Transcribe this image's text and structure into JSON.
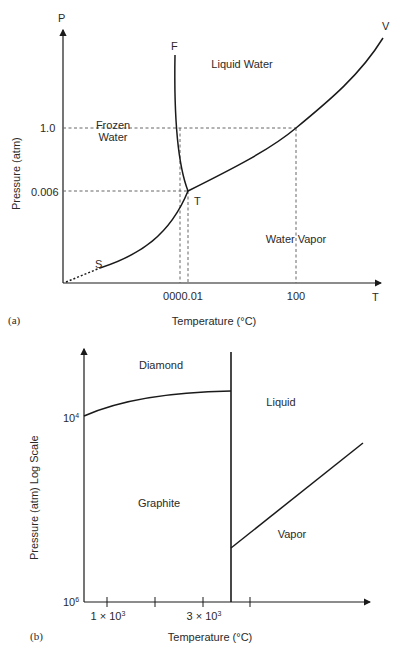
{
  "figure_a": {
    "panel_label": "(a)",
    "y_axis_symbol": "P",
    "x_axis_symbol": "T",
    "y_axis_title": "Pressure (atm)",
    "x_axis_title": "Temperature (°C)",
    "y_ticks": [
      "1.0",
      "0.006"
    ],
    "x_ticks": [
      "0000.01",
      "100"
    ],
    "regions": {
      "frozen_line1": "Frozen",
      "frozen_line2": "Water",
      "liquid": "Liquid Water",
      "vapor": "Water Vapor"
    },
    "point_labels": {
      "fusion": "F",
      "vaporization": "V",
      "triple": "T",
      "sublimation": "S"
    }
  },
  "figure_b": {
    "panel_label": "(b)",
    "y_axis_title": "Pressure (atm) Log Scale",
    "x_axis_title": "Temperature (°C)",
    "y_ticks": [
      {
        "base": "10",
        "exp": "4"
      },
      {
        "base": "10",
        "exp": "6"
      }
    ],
    "x_ticks": [
      {
        "mant": "1 × 10",
        "exp": "3"
      },
      {
        "mant": "3 × 10",
        "exp": "3"
      }
    ],
    "regions": {
      "diamond": "Diamond",
      "liquid": "Liquid",
      "graphite": "Graphite",
      "vapor": "Vapor"
    }
  },
  "colors": {
    "line": "#1a1a1a",
    "dashed": "#666666",
    "text": "#2a2a2a"
  }
}
